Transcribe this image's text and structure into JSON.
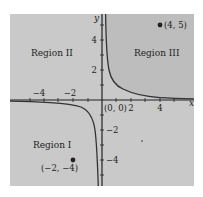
{
  "figure": {
    "function": "y = 1/x",
    "colors": {
      "background": "#c9c9c9",
      "region_iii": "#bdbdbd",
      "axis": "#222222",
      "curve": "#333333",
      "point": "#222222"
    },
    "axes": {
      "x_label": "x",
      "y_label": "y",
      "x_ticks": [
        {
          "value": -4,
          "label": "−4"
        },
        {
          "value": -2,
          "label": "−2"
        },
        {
          "value": 2,
          "label": "2"
        },
        {
          "value": 4,
          "label": "4"
        }
      ],
      "y_ticks": [
        {
          "value": 4,
          "label": "4"
        },
        {
          "value": 2,
          "label": "2"
        },
        {
          "value": -2,
          "label": "−2"
        },
        {
          "value": -4,
          "label": "−4"
        }
      ],
      "origin_label": "(0, 0)"
    },
    "regions": [
      {
        "name": "Region I",
        "label": "Region I"
      },
      {
        "name": "Region II",
        "label": "Region II"
      },
      {
        "name": "Region III",
        "label": "Region III"
      }
    ],
    "points": [
      {
        "label": "(4, 5)",
        "x": 4,
        "y": 5
      },
      {
        "label": "(−2, −4)",
        "x": -2,
        "y": -4
      }
    ]
  }
}
